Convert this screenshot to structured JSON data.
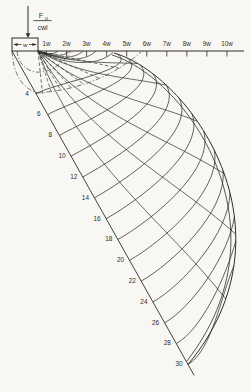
{
  "figure": {
    "force_label": {
      "numerator_base": "F",
      "numerator_sub": "u",
      "denominator": "cwl"
    },
    "load_width_label": "w",
    "axis_tick_labels": [
      "1w",
      "2w",
      "3w",
      "4w",
      "5w",
      "6w",
      "7w",
      "8w",
      "9w",
      "10w"
    ],
    "diagonal_labels": [
      "4",
      "6",
      "8",
      "10",
      "12",
      "14",
      "16",
      "18",
      "20",
      "22",
      "24",
      "26",
      "28",
      "30"
    ],
    "colors": {
      "ink": "#2e2c29",
      "background": "#f8f7f4"
    }
  }
}
